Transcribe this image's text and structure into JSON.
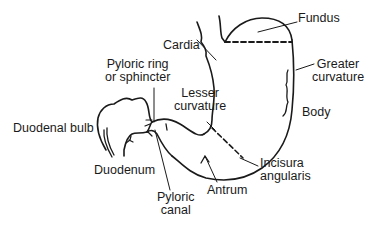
{
  "diagram": {
    "labels": {
      "fundus": "Fundus",
      "cardia": "Cardia",
      "greater_curvature": [
        "Greater",
        "curvature"
      ],
      "pyloric_ring": [
        "Pyloric ring",
        "or sphincter"
      ],
      "lesser_curvature": [
        "Lesser",
        "curvature"
      ],
      "body": "Body",
      "duodenal_bulb": "Duodenal bulb",
      "duodenum": "Duodenum",
      "incisura_angularis": [
        "Incisura",
        "angularis"
      ],
      "pyloric_canal": [
        "Pyloric",
        "canal"
      ],
      "antrum": "Antrum"
    },
    "colors": {
      "line": "#1a1a1a",
      "background": "#ffffff"
    }
  }
}
